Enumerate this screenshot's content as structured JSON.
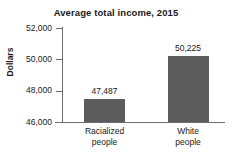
{
  "chart_data": {
    "type": "bar",
    "title": "Average total income, 2015",
    "xlabel": "",
    "ylabel": "Dollars",
    "categories": [
      "Racialized\npeople",
      "White\npeople"
    ],
    "category_lines": [
      [
        "Racialized",
        "people"
      ],
      [
        "White",
        "people"
      ]
    ],
    "values": [
      47487,
      50225
    ],
    "value_labels": [
      "47,487",
      "50,225"
    ],
    "ylim": [
      46000,
      52000
    ],
    "yticks": [
      46000,
      48000,
      50000,
      52000
    ],
    "ytick_labels": [
      "46,000",
      "48,000",
      "50,000",
      "52,000"
    ],
    "grid": false,
    "legend": false,
    "bar_color": "#5c5c5c",
    "axis_color": "#6d6d6d",
    "text_color": "#1a1a1a",
    "background": "#ffffff"
  }
}
